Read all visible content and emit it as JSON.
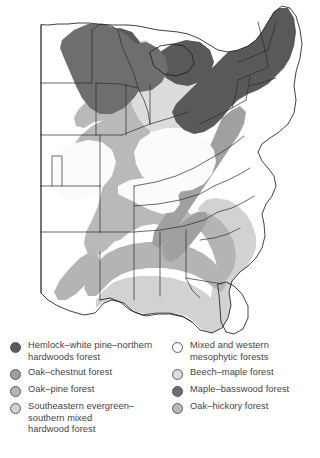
{
  "figure": {
    "type": "thematic-map"
  },
  "map": {
    "name": "eastern-us-forest-regions-map",
    "background_color": "#ffffff",
    "state_border_color": "#2b2b2b",
    "coast_border_color": "#1f1f1f"
  },
  "legend": {
    "columns": [
      {
        "name": "legend-column-left",
        "items": [
          {
            "id": "hemlock-white-pine-northern-hardwoods-forest",
            "label": "Hemlock–white pine–northern\nhardwoods forest",
            "color": "#595959"
          },
          {
            "id": "oak-chestnut-forest",
            "label": "Oak–chestnut forest",
            "color": "#a0a0a0"
          },
          {
            "id": "oak-pine-forest",
            "label": "Oak–pine forest",
            "color": "#b4b4b4"
          },
          {
            "id": "southeastern-evergreen-southern-mixed-hardwood-forest",
            "label": "Southeastern evergreen–\nsouthern mixed\nhardwood forest",
            "color": "#d2d2d2"
          }
        ]
      },
      {
        "name": "legend-column-right",
        "items": [
          {
            "id": "mixed-and-western-mesophytic-forests",
            "label": "Mixed and western\nmesophytic forests",
            "color": "#fbfbfb"
          },
          {
            "id": "beech-maple-forest",
            "label": "Beech–maple forest",
            "color": "#dcdcdc"
          },
          {
            "id": "maple-basswood-forest",
            "label": "Maple–basswood forest",
            "color": "#6e6e6e"
          },
          {
            "id": "oak-hickory-forest",
            "label": "Oak–hickory forest",
            "color": "#b9b9b9"
          }
        ]
      }
    ]
  }
}
